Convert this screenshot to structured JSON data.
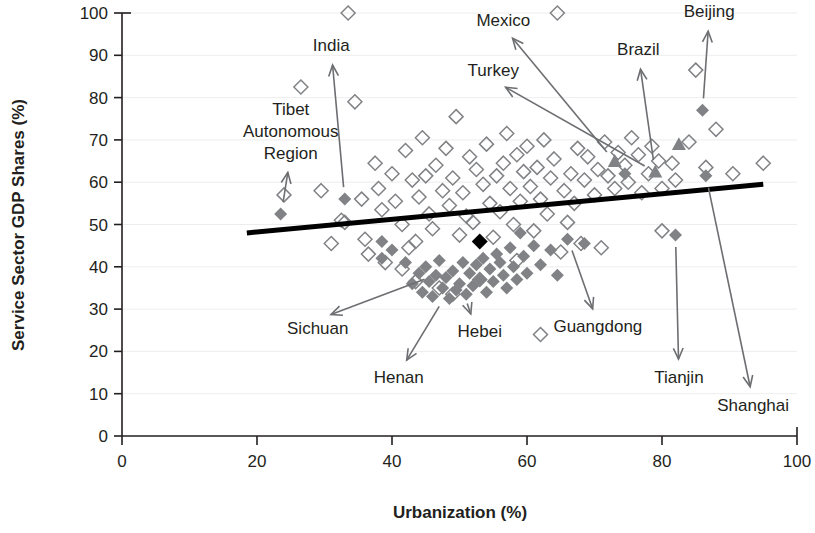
{
  "chart_data": {
    "type": "scatter",
    "title": "",
    "xlabel": "Urbanization (%)",
    "ylabel": "Service Sector GDP Shares (%)",
    "xlim": [
      0,
      100
    ],
    "ylim": [
      0,
      100
    ],
    "xticks": [
      "0",
      "20",
      "40",
      "60",
      "80",
      "100"
    ],
    "yticks": [
      "0",
      "10",
      "20",
      "30",
      "40",
      "50",
      "60",
      "70",
      "80",
      "90",
      "100"
    ],
    "grid": "horizontal-light",
    "legend": "none",
    "trendline": {
      "label": "",
      "x_start": 18.5,
      "y_start": 48.0,
      "x_end": 95.0,
      "y_end": 59.5
    },
    "series": [
      {
        "name": "Other countries",
        "marker": "open-diamond",
        "color": "#808285",
        "points": [
          [
            24.0,
            57.0
          ],
          [
            26.5,
            82.5
          ],
          [
            29.5,
            58.0
          ],
          [
            31.0,
            45.5
          ],
          [
            32.5,
            51.0
          ],
          [
            33.5,
            100.0
          ],
          [
            34.5,
            79.0
          ],
          [
            33.0,
            50.5
          ],
          [
            35.5,
            56.0
          ],
          [
            36.0,
            46.5
          ],
          [
            36.5,
            43.0
          ],
          [
            37.5,
            64.5
          ],
          [
            38.5,
            53.5
          ],
          [
            38.0,
            58.5
          ],
          [
            39.0,
            41.0
          ],
          [
            40.0,
            62.0
          ],
          [
            40.5,
            55.5
          ],
          [
            41.5,
            50.0
          ],
          [
            42.0,
            67.5
          ],
          [
            42.5,
            44.5
          ],
          [
            43.0,
            60.5
          ],
          [
            43.5,
            46.0
          ],
          [
            44.5,
            70.5
          ],
          [
            44.0,
            56.5
          ],
          [
            45.0,
            61.5
          ],
          [
            45.5,
            52.5
          ],
          [
            46.5,
            64.0
          ],
          [
            46.0,
            49.0
          ],
          [
            47.5,
            58.0
          ],
          [
            48.0,
            68.0
          ],
          [
            48.5,
            54.5
          ],
          [
            49.5,
            75.5
          ],
          [
            49.0,
            61.0
          ],
          [
            50.0,
            47.5
          ],
          [
            50.5,
            57.5
          ],
          [
            51.5,
            66.0
          ],
          [
            51.0,
            52.0
          ],
          [
            52.5,
            63.0
          ],
          [
            52.0,
            50.5
          ],
          [
            53.5,
            59.5
          ],
          [
            54.0,
            69.0
          ],
          [
            54.5,
            55.0
          ],
          [
            55.5,
            61.5
          ],
          [
            55.0,
            47.0
          ],
          [
            56.5,
            64.5
          ],
          [
            56.0,
            53.0
          ],
          [
            57.5,
            58.5
          ],
          [
            57.0,
            71.5
          ],
          [
            58.5,
            66.5
          ],
          [
            58.0,
            50.0
          ],
          [
            59.5,
            62.5
          ],
          [
            59.0,
            55.5
          ],
          [
            60.5,
            59.0
          ],
          [
            60.0,
            68.5
          ],
          [
            61.5,
            63.5
          ],
          [
            61.0,
            48.5
          ],
          [
            62.5,
            70.0
          ],
          [
            62.0,
            56.0
          ],
          [
            63.5,
            61.0
          ],
          [
            63.0,
            52.5
          ],
          [
            64.5,
            100.0
          ],
          [
            64.0,
            65.5
          ],
          [
            65.5,
            58.0
          ],
          [
            65.0,
            43.5
          ],
          [
            66.5,
            62.0
          ],
          [
            66.0,
            50.5
          ],
          [
            67.5,
            68.0
          ],
          [
            67.0,
            55.0
          ],
          [
            68.5,
            60.5
          ],
          [
            69.0,
            66.0
          ],
          [
            70.5,
            63.0
          ],
          [
            70.0,
            57.0
          ],
          [
            71.5,
            69.5
          ],
          [
            72.0,
            61.5
          ],
          [
            73.5,
            67.0
          ],
          [
            73.0,
            58.5
          ],
          [
            74.5,
            64.0
          ],
          [
            75.5,
            70.5
          ],
          [
            75.0,
            60.0
          ],
          [
            76.5,
            66.5
          ],
          [
            77.0,
            57.5
          ],
          [
            78.5,
            68.5
          ],
          [
            78.0,
            62.0
          ],
          [
            79.5,
            65.0
          ],
          [
            80.0,
            58.5
          ],
          [
            81.5,
            64.5
          ],
          [
            82.0,
            60.5
          ],
          [
            84.0,
            69.5
          ],
          [
            85.0,
            86.5
          ],
          [
            86.5,
            63.5
          ],
          [
            88.0,
            72.5
          ],
          [
            90.5,
            62.0
          ],
          [
            95.0,
            64.5
          ],
          [
            62.0,
            24.0
          ],
          [
            47.0,
            35.0
          ],
          [
            49.0,
            33.5
          ],
          [
            53.0,
            37.0
          ],
          [
            58.5,
            41.5
          ],
          [
            43.5,
            36.5
          ],
          [
            41.5,
            39.5
          ],
          [
            68.0,
            45.5
          ],
          [
            71.0,
            44.5
          ],
          [
            80.0,
            48.5
          ]
        ]
      },
      {
        "name": "Chinese provinces",
        "marker": "filled-diamond",
        "color": "#808285",
        "points": [
          [
            23.5,
            52.5
          ],
          [
            33.0,
            56.0
          ],
          [
            38.5,
            46.0
          ],
          [
            42.0,
            41.0
          ],
          [
            43.0,
            36.0
          ],
          [
            44.0,
            38.5
          ],
          [
            44.5,
            34.0
          ],
          [
            45.0,
            40.0
          ],
          [
            45.5,
            36.5
          ],
          [
            46.0,
            33.0
          ],
          [
            46.5,
            38.0
          ],
          [
            47.0,
            41.5
          ],
          [
            47.5,
            35.0
          ],
          [
            48.0,
            37.5
          ],
          [
            48.5,
            32.5
          ],
          [
            49.0,
            39.0
          ],
          [
            49.5,
            34.5
          ],
          [
            50.0,
            36.0
          ],
          [
            50.5,
            41.0
          ],
          [
            51.0,
            33.5
          ],
          [
            51.5,
            38.5
          ],
          [
            52.0,
            35.5
          ],
          [
            52.5,
            40.5
          ],
          [
            53.0,
            37.0
          ],
          [
            53.5,
            42.0
          ],
          [
            54.0,
            34.0
          ],
          [
            54.5,
            39.5
          ],
          [
            55.0,
            36.5
          ],
          [
            55.5,
            43.0
          ],
          [
            56.0,
            41.0
          ],
          [
            56.5,
            38.0
          ],
          [
            57.0,
            35.0
          ],
          [
            57.5,
            44.5
          ],
          [
            58.0,
            40.0
          ],
          [
            58.5,
            37.0
          ],
          [
            59.5,
            42.5
          ],
          [
            60.0,
            38.5
          ],
          [
            61.0,
            45.0
          ],
          [
            62.0,
            40.5
          ],
          [
            63.5,
            44.0
          ],
          [
            64.5,
            38.0
          ],
          [
            66.0,
            46.5
          ],
          [
            68.5,
            45.5
          ],
          [
            74.5,
            62.0
          ],
          [
            82.0,
            47.5
          ],
          [
            86.5,
            61.5
          ],
          [
            86.0,
            77.0
          ],
          [
            38.5,
            42.0
          ],
          [
            40.0,
            44.0
          ],
          [
            59.0,
            48.0
          ]
        ]
      },
      {
        "name": "Highlighted countries",
        "marker": "filled-triangle",
        "color": "#808285",
        "points": [
          [
            73.0,
            65.0
          ],
          [
            79.0,
            62.5
          ],
          [
            82.5,
            69.0
          ]
        ]
      },
      {
        "name": "China national average",
        "marker": "filled-diamond-black",
        "color": "#000000",
        "points": [
          [
            53.0,
            46.0
          ]
        ]
      }
    ],
    "annotations": [
      {
        "label": "Tibet Autonomous Region",
        "lines": [
          "Tibet",
          "Autonomous",
          "Region"
        ],
        "text_x": 25.0,
        "text_y": 76.0,
        "target_x": 23.5,
        "target_y": 52.5,
        "align": "center"
      },
      {
        "label": "India",
        "lines": [
          "India"
        ],
        "text_x": 31.0,
        "text_y": 91.0,
        "target_x": 33.0,
        "target_y": 56.0,
        "align": "center"
      },
      {
        "label": "Mexico",
        "lines": [
          "Mexico"
        ],
        "text_x": 56.5,
        "text_y": 97.0,
        "target_x": 73.0,
        "target_y": 65.0,
        "align": "center"
      },
      {
        "label": "Turkey",
        "lines": [
          "Turkey"
        ],
        "text_x": 55.0,
        "text_y": 85.0,
        "target_x": 79.0,
        "target_y": 62.5,
        "align": "center"
      },
      {
        "label": "Brazil",
        "lines": [
          "Brazil"
        ],
        "text_x": 76.5,
        "text_y": 90.0,
        "target_x": 79.0,
        "target_y": 62.5,
        "align": "center"
      },
      {
        "label": "Beijing",
        "lines": [
          "Beijing"
        ],
        "text_x": 87.0,
        "text_y": 99.0,
        "target_x": 86.0,
        "target_y": 77.0,
        "align": "center"
      },
      {
        "label": "Sichuan",
        "lines": [
          "Sichuan"
        ],
        "text_x": 29.0,
        "text_y": 24.0,
        "target_x": 46.5,
        "target_y": 38.0,
        "align": "center"
      },
      {
        "label": "Henan",
        "lines": [
          "Henan"
        ],
        "text_x": 41.0,
        "text_y": 12.5,
        "target_x": 48.0,
        "target_y": 33.0,
        "align": "center"
      },
      {
        "label": "Hebei",
        "lines": [
          "Hebei"
        ],
        "text_x": 53.0,
        "text_y": 23.5,
        "target_x": 50.0,
        "target_y": 33.5,
        "align": "center"
      },
      {
        "label": "Guangdong",
        "lines": [
          "Guangdong"
        ],
        "text_x": 70.5,
        "text_y": 24.5,
        "target_x": 66.0,
        "target_y": 46.5,
        "align": "center"
      },
      {
        "label": "Tianjin",
        "lines": [
          "Tianjin"
        ],
        "text_x": 82.5,
        "text_y": 12.5,
        "target_x": 82.0,
        "target_y": 47.5,
        "align": "center"
      },
      {
        "label": "Shanghai",
        "lines": [
          "Shanghai"
        ],
        "text_x": 93.5,
        "text_y": 6.0,
        "target_x": 86.5,
        "target_y": 61.5,
        "align": "center"
      }
    ]
  }
}
